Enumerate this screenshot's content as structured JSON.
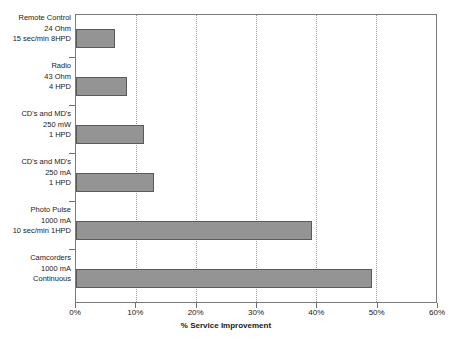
{
  "chart_data": {
    "type": "bar",
    "orientation": "horizontal",
    "title": "",
    "xlabel": "% Service Improvement",
    "ylabel": "",
    "xlim": [
      0,
      60
    ],
    "xticks": [
      "0%",
      "10%",
      "20%",
      "30%",
      "40%",
      "50%",
      "60%"
    ],
    "xtick_values": [
      0,
      10,
      20,
      30,
      40,
      50,
      60
    ],
    "grid": "vertical dotted gridlines at each 10% tick",
    "legend": "none",
    "bar_color": "#949494",
    "bar_edge_color": "#5a5a5a",
    "categories": [
      "Remote Control 24 Ohm 15 sec/min 8HPD",
      "Radio 43 Ohm 4 HPD",
      "CD's and MD's 250 mW 1 HPD",
      "CD's and MD's 250 mA 1 HPD",
      "Photo Pulse 1000 mA 10 sec/min 1HPD",
      "Camcorders 1000 mA Continuous"
    ],
    "category_lines": [
      [
        "Remote Control",
        "24 Ohm",
        "15 sec/min 8HPD"
      ],
      [
        "Radio",
        "43 Ohm",
        "4 HPD"
      ],
      [
        "CD's and MD's",
        "250 mW",
        "1 HPD"
      ],
      [
        "CD's and MD's",
        "250 mA",
        "1 HPD"
      ],
      [
        "Photo Pulse",
        "1000 mA",
        "10 sec/min 1HPD"
      ],
      [
        "Camcorders",
        "1000 mA",
        "Continuous"
      ]
    ],
    "values": [
      6.5,
      8.5,
      11.3,
      13.0,
      39.3,
      49.3
    ]
  }
}
